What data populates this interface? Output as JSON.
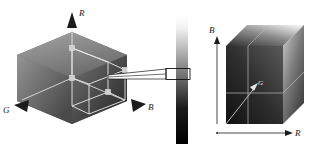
{
  "figure": {
    "background_color": "#ffffff"
  },
  "left_panel": {
    "name": "isometric-rgb-cube",
    "shape": "hexagon-isometric-cube",
    "axes": [
      {
        "id": "R",
        "label": "R",
        "direction": "up",
        "arrow": "triangle-up"
      },
      {
        "id": "G",
        "label": "G",
        "direction": "down-left",
        "arrow": "triangle-left"
      },
      {
        "id": "B",
        "label": "B",
        "direction": "down-right",
        "arrow": "triangle-right"
      }
    ],
    "faces": [
      {
        "id": "top-face",
        "fill_from": "#9c9c9c",
        "fill_to": "#6f6f6f"
      },
      {
        "id": "left-face",
        "fill_from": "#8f8f8f",
        "fill_to": "#4e4e4e"
      },
      {
        "id": "right-face",
        "fill_from": "#6a6a6a",
        "fill_to": "#2b2b2b"
      }
    ],
    "wireframe_box": {
      "name": "inner-sub-volume",
      "stroke": "#e8e8e8",
      "corner_markers": 4,
      "corner_labels": [
        "",
        "",
        "",
        ""
      ]
    }
  },
  "probe": {
    "name": "tapered-probe-pointer",
    "stroke": "#111111",
    "description": "thin tapered pointer from cube to gradient strip"
  },
  "strip": {
    "name": "grayscale-gradient-strip",
    "gradient_top_color": "#ffffff",
    "gradient_bottom_color": "#000000",
    "selection_box": {
      "name": "strip-selection-box",
      "stroke": "#111111"
    }
  },
  "right_panel": {
    "name": "projected-rgb-cube",
    "axes": [
      {
        "id": "B",
        "label": "B",
        "direction": "up",
        "arrow": "arrow-up"
      },
      {
        "id": "R",
        "label": "R",
        "direction": "right",
        "arrow": "arrow-right"
      },
      {
        "id": "G",
        "label": "G",
        "direction": "diagonal-up-right",
        "arrow": "arrow-diagonal"
      }
    ],
    "faces": [
      {
        "id": "front-face",
        "fill_from": "#4a4a4a",
        "fill_to": "#151515"
      },
      {
        "id": "top-face",
        "fill_from": "#d8d8d8",
        "fill_to": "#3a3a3a"
      },
      {
        "id": "side-face",
        "fill_from": "#bdbdbd",
        "fill_to": "#3f3f3f"
      }
    ],
    "guide_lines": {
      "name": "interior-guide-lines",
      "stroke": "#b9b9b9"
    }
  },
  "colors": {
    "ink": "#1a1a1a",
    "light_line": "#e8e8e8",
    "mid_line": "#b9b9b9"
  }
}
